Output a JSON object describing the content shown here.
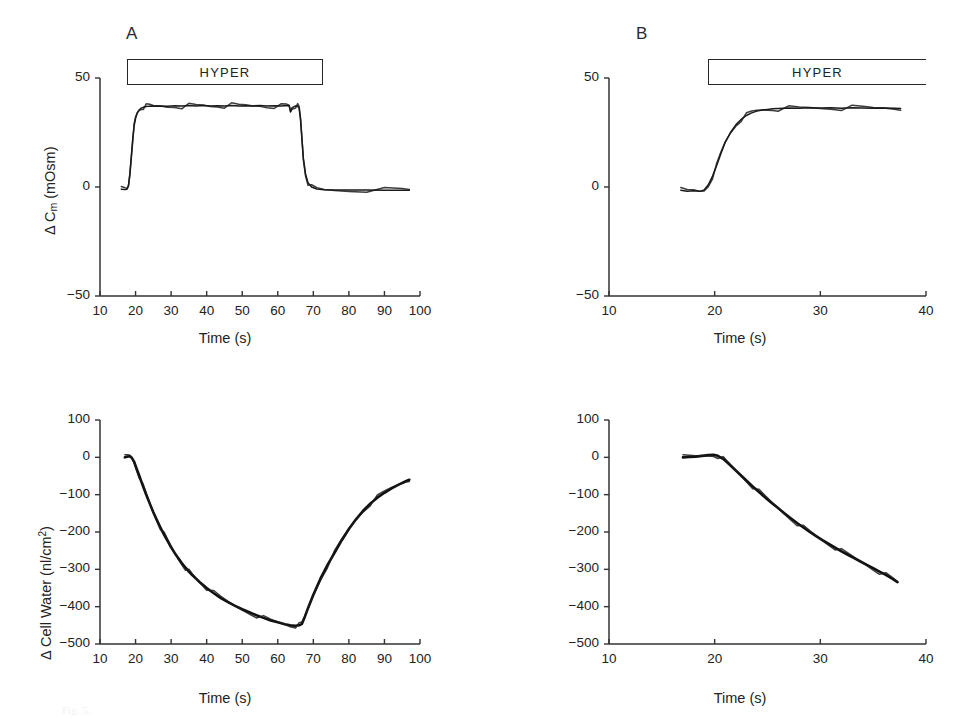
{
  "figure": {
    "panels": [
      {
        "letter": "A"
      },
      {
        "letter": "B"
      }
    ],
    "hyper_label": "HYPER",
    "caption_fragment": "Fig. 5."
  },
  "chart_data": [
    {
      "id": "panel-a-cm",
      "type": "line",
      "title": "A",
      "xlabel": "Time (s)",
      "ylabel": "Δ Cm (mOsm)",
      "ylabel_parts": {
        "prefix": "Δ C",
        "sub": "m",
        "suffix": " (mOsm)"
      },
      "xlim": [
        10,
        100
      ],
      "ylim": [
        -50,
        50
      ],
      "xticks": [
        10,
        20,
        30,
        40,
        50,
        60,
        70,
        80,
        90,
        100
      ],
      "yticks": [
        50,
        0,
        -50
      ],
      "grid": false,
      "legend": null,
      "annotations": [
        {
          "text": "HYPER",
          "type": "bar",
          "x_start": 17.5,
          "x_end": 66.5,
          "y": 46
        }
      ],
      "series": [
        {
          "name": "Δ Cm",
          "x": [
            16.0,
            17.0,
            17.6,
            18.0,
            18.4,
            18.8,
            19.2,
            19.6,
            20.0,
            20.5,
            21.0,
            21.6,
            22.2,
            23.0,
            24.0,
            25.0,
            27.0,
            29.0,
            31.0,
            33.0,
            35.0,
            37.0,
            39.0,
            41.0,
            43.0,
            45.0,
            47.0,
            49.0,
            51.0,
            53.0,
            55.0,
            57.0,
            59.0,
            61.0,
            62.5,
            63.2,
            63.6,
            64.0,
            65.0,
            65.6,
            66.0,
            66.4,
            66.8,
            67.2,
            67.8,
            68.5,
            69.5,
            71.0,
            73.0,
            76.0,
            80.0,
            85.0,
            90.0,
            95.0,
            97.0
          ],
          "y": [
            -1.0,
            -1.2,
            -1.0,
            0.5,
            6.0,
            14.0,
            22.0,
            28.0,
            31.5,
            34.0,
            35.3,
            36.2,
            36.6,
            36.9,
            37.1,
            37.0,
            37.2,
            37.0,
            37.3,
            37.1,
            37.4,
            37.2,
            37.4,
            37.1,
            37.3,
            37.2,
            37.4,
            37.1,
            37.3,
            37.2,
            37.4,
            37.2,
            37.3,
            37.2,
            37.4,
            37.3,
            34.6,
            36.3,
            37.2,
            37.0,
            36.2,
            31.0,
            22.0,
            13.0,
            6.0,
            2.0,
            0.0,
            -0.9,
            -1.3,
            -1.4,
            -1.4,
            -1.4,
            -1.5,
            -1.5,
            -1.5
          ]
        }
      ]
    },
    {
      "id": "panel-b-cm",
      "type": "line",
      "title": "B",
      "xlabel": "Time (s)",
      "ylabel": "Δ Cm (mOsm)",
      "ylabel_parts": {
        "prefix": "Δ C",
        "sub": "m",
        "suffix": " (mOsm)"
      },
      "xlim": [
        10,
        40
      ],
      "ylim": [
        -50,
        50
      ],
      "xticks": [
        10,
        20,
        30,
        40
      ],
      "yticks": [
        50,
        0,
        -50
      ],
      "grid": false,
      "legend": null,
      "annotations": [
        {
          "text": "HYPER",
          "type": "bar",
          "x_start": 19.0,
          "x_end": 40.0,
          "y": 46
        }
      ],
      "series": [
        {
          "name": "Δ Cm",
          "x": [
            16.8,
            17.4,
            18.0,
            18.6,
            19.0,
            19.4,
            19.8,
            20.2,
            20.6,
            21.0,
            21.5,
            22.0,
            22.5,
            23.0,
            23.5,
            24.0,
            24.5,
            25.0,
            25.5,
            26.0,
            27.0,
            28.0,
            29.0,
            30.0,
            31.0,
            32.0,
            33.0,
            34.0,
            35.0,
            36.0,
            37.0,
            37.6
          ],
          "y": [
            -1.5,
            -2.0,
            -1.7,
            -2.0,
            -1.4,
            1.0,
            5.0,
            10.0,
            15.5,
            20.5,
            25.0,
            28.5,
            31.0,
            32.8,
            34.0,
            34.8,
            35.3,
            35.6,
            35.9,
            36.0,
            36.2,
            36.1,
            36.3,
            36.2,
            36.3,
            36.1,
            36.3,
            36.2,
            36.1,
            36.2,
            36.1,
            36.0
          ]
        }
      ]
    },
    {
      "id": "panel-a-cellwater",
      "type": "line",
      "title": "A",
      "xlabel": "Time (s)",
      "ylabel": "Δ Cell Water (nl/cm2)",
      "ylabel_parts": {
        "prefix": "Δ Cell Water (nl/cm",
        "sup": "2",
        "suffix": ")"
      },
      "xlim": [
        10,
        100
      ],
      "ylim": [
        -500,
        100
      ],
      "xticks": [
        10,
        20,
        30,
        40,
        50,
        60,
        70,
        80,
        90,
        100
      ],
      "yticks": [
        100,
        0,
        -100,
        -200,
        -300,
        -400,
        -500
      ],
      "grid": false,
      "legend": null,
      "annotations": [],
      "series": [
        {
          "name": "Δ Cell Water",
          "x": [
            17.0,
            17.8,
            18.4,
            19.0,
            19.6,
            20.2,
            21.0,
            22.0,
            23.0,
            24.0,
            25.0,
            26.0,
            27.0,
            28.0,
            29.0,
            30.0,
            31.0,
            32.0,
            33.0,
            34.0,
            35.0,
            36.0,
            37.0,
            38.0,
            39.0,
            40.0,
            42.0,
            44.0,
            46.0,
            48.0,
            50.0,
            52.0,
            54.0,
            56.0,
            58.0,
            60.0,
            62.0,
            63.5,
            65.0,
            66.0,
            66.8,
            67.5,
            68.5,
            70.0,
            72.0,
            74.0,
            76.0,
            78.0,
            80.0,
            82.0,
            84.0,
            86.0,
            88.0,
            90.0,
            92.0,
            94.0,
            96.0,
            97.0
          ],
          "y": [
            0.0,
            2.0,
            3.0,
            -2.0,
            -12.0,
            -28.0,
            -48.0,
            -75.0,
            -100.0,
            -124.0,
            -147.0,
            -168.0,
            -188.0,
            -207.0,
            -224.0,
            -241.0,
            -256.0,
            -270.0,
            -283.0,
            -295.0,
            -306.0,
            -316.0,
            -325.0,
            -334.0,
            -342.0,
            -350.0,
            -364.0,
            -377.0,
            -388.0,
            -398.0,
            -407.0,
            -415.0,
            -423.0,
            -430.0,
            -437.0,
            -442.0,
            -447.0,
            -450.0,
            -451.0,
            -450.0,
            -446.0,
            -430.0,
            -404.0,
            -368.0,
            -325.0,
            -288.0,
            -255.0,
            -222.0,
            -192.0,
            -166.0,
            -143.0,
            -124.0,
            -108.0,
            -95.0,
            -83.0,
            -73.0,
            -64.0,
            -60.0
          ]
        }
      ]
    },
    {
      "id": "panel-b-cellwater",
      "type": "line",
      "title": "B",
      "xlabel": "Time (s)",
      "ylabel": "Δ Cell Water (nl/cm2)",
      "ylabel_parts": {
        "prefix": "Δ Cell Water (nl/cm",
        "sup": "2",
        "suffix": ")"
      },
      "xlim": [
        10,
        40
      ],
      "ylim": [
        -500,
        100
      ],
      "xticks": [
        10,
        20,
        30,
        40
      ],
      "yticks": [
        100,
        0,
        -100,
        -200,
        -300,
        -400,
        -500
      ],
      "grid": false,
      "legend": null,
      "annotations": [],
      "series": [
        {
          "name": "Δ Cell Water",
          "x": [
            17.0,
            17.6,
            18.2,
            18.8,
            19.4,
            19.9,
            20.3,
            20.8,
            21.2,
            21.8,
            22.4,
            23.0,
            23.6,
            24.2,
            24.8,
            25.4,
            26.0,
            26.6,
            27.2,
            27.8,
            28.4,
            29.0,
            29.6,
            30.2,
            30.8,
            31.4,
            32.0,
            32.6,
            33.2,
            33.8,
            34.4,
            35.0,
            35.6,
            36.2,
            36.8,
            37.3
          ],
          "y": [
            0.0,
            1.0,
            2.0,
            4.0,
            6.0,
            7.0,
            4.0,
            -4.0,
            -14.0,
            -30.0,
            -46.0,
            -62.0,
            -78.0,
            -93.0,
            -108.0,
            -122.0,
            -136.0,
            -150.0,
            -163.0,
            -176.0,
            -188.0,
            -200.0,
            -211.0,
            -222.0,
            -232.0,
            -242.0,
            -252.0,
            -261.0,
            -270.0,
            -279.0,
            -288.0,
            -297.0,
            -306.0,
            -315.0,
            -325.0,
            -334.0
          ]
        }
      ]
    }
  ]
}
